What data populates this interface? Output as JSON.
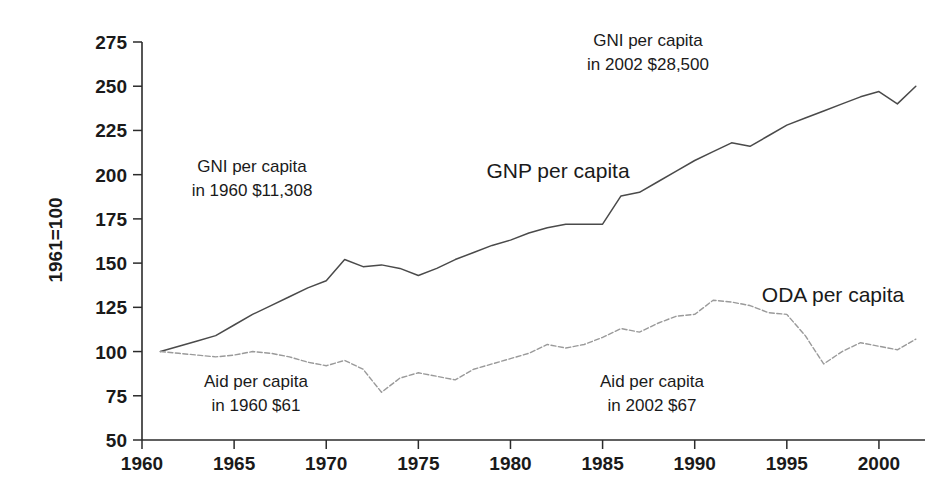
{
  "chart_data": {
    "type": "line",
    "title": "",
    "xlabel": "",
    "ylabel": "1961=100",
    "xlim": [
      1960,
      2002.5
    ],
    "ylim": [
      50,
      275
    ],
    "grid": false,
    "legend_position": "inline-annotations",
    "x_ticks": [
      1960,
      1965,
      1970,
      1975,
      1980,
      1985,
      1990,
      1995,
      2000
    ],
    "y_ticks": [
      50,
      75,
      100,
      125,
      150,
      175,
      200,
      225,
      250,
      275
    ],
    "x": [
      1961,
      1962,
      1963,
      1964,
      1965,
      1966,
      1967,
      1968,
      1969,
      1970,
      1971,
      1972,
      1973,
      1974,
      1975,
      1976,
      1977,
      1978,
      1979,
      1980,
      1981,
      1982,
      1983,
      1984,
      1985,
      1986,
      1987,
      1988,
      1989,
      1990,
      1991,
      1992,
      1993,
      1994,
      1995,
      1996,
      1997,
      1998,
      1999,
      2000,
      2001,
      2002
    ],
    "series": [
      {
        "name": "GNP per capita",
        "style": "solid",
        "color": "#4a4a4a",
        "values": [
          100,
          103,
          106,
          109,
          115,
          121,
          126,
          131,
          136,
          140,
          152,
          148,
          149,
          147,
          143,
          147,
          152,
          156,
          160,
          163,
          167,
          170,
          172,
          172,
          172,
          188,
          190,
          196,
          202,
          208,
          213,
          218,
          216,
          222,
          228,
          232,
          236,
          240,
          244,
          247,
          240,
          250
        ]
      },
      {
        "name": "ODA per capita",
        "style": "dotted",
        "color": "#9a9a9a",
        "values": [
          100,
          99,
          98,
          97,
          98,
          100,
          99,
          97,
          94,
          92,
          95,
          90,
          77,
          85,
          88,
          86,
          84,
          90,
          93,
          96,
          99,
          104,
          102,
          104,
          108,
          113,
          111,
          116,
          120,
          121,
          129,
          128,
          126,
          122,
          121,
          109,
          93,
          100,
          105,
          103,
          101,
          107
        ]
      }
    ],
    "annotations": [
      {
        "id": "gni-1960",
        "lines": [
          "GNI per capita",
          "in 1960 $11,308"
        ],
        "x_px": 252,
        "y_px": 172
      },
      {
        "id": "gni-2002",
        "lines": [
          "GNI per capita",
          "in 2002 $28,500"
        ],
        "x_px": 648,
        "y_px": 46
      },
      {
        "id": "aid-1960",
        "lines": [
          "Aid per capita",
          "in 1960 $61"
        ],
        "x_px": 256,
        "y_px": 387
      },
      {
        "id": "aid-2002",
        "lines": [
          "Aid per capita",
          "in 2002 $67"
        ],
        "x_px": 652,
        "y_px": 387
      }
    ],
    "series_labels": [
      {
        "id": "gnp-label",
        "text": "GNP per capita",
        "x_px": 558,
        "y_px": 178
      },
      {
        "id": "oda-label",
        "text": "ODA per capita",
        "x_px": 833,
        "y_px": 302
      }
    ]
  }
}
